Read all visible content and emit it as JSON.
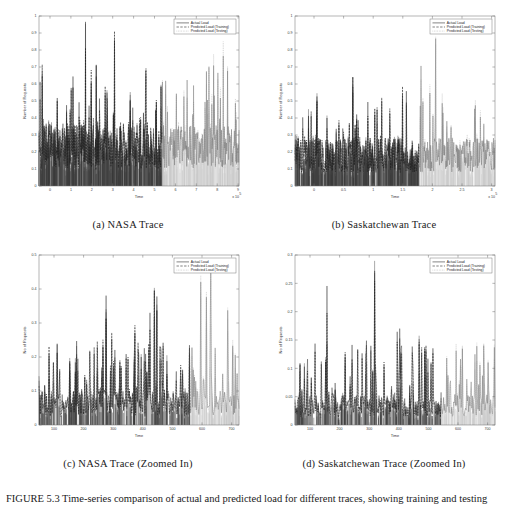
{
  "figure": {
    "caption": "FIGURE 5.3 Time-series comparison of actual and predicted load for different traces, showing training and testing phases."
  },
  "legend": {
    "entries": [
      {
        "label": "Actual Load",
        "style": "solid",
        "color": "#333333"
      },
      {
        "label": "Predicted Load (Training)",
        "style": "dashed",
        "color": "#2b2b2b"
      },
      {
        "label": "Predicted Load (Testing)",
        "style": "dotted",
        "color": "#9a9a9a"
      }
    ]
  },
  "panels": [
    {
      "id": "a",
      "caption": "(a) NASA Trace",
      "ylabel": "Number of Requests",
      "xlabel": "Time",
      "exponent": "x 10",
      "exponent_sup": "5",
      "yticks": [
        "0",
        "0.1",
        "0.2",
        "0.3",
        "0.4",
        "0.5",
        "0.6",
        "0.7",
        "0.8",
        "0.9",
        "1"
      ],
      "xticks": [
        "0",
        "1",
        "2",
        "3",
        "4",
        "5",
        "6",
        "7",
        "8",
        "9"
      ],
      "split_label": "training/testing boundary",
      "split_fraction": 0.615
    },
    {
      "id": "b",
      "caption": "(b) Saskatchewan Trace",
      "ylabel": "Number of Requests",
      "xlabel": "Time",
      "exponent": "x 10",
      "exponent_sup": "5",
      "yticks": [
        "0",
        "0.1",
        "0.2",
        "0.3",
        "0.4",
        "0.5",
        "0.6",
        "0.7",
        "0.8",
        "0.9",
        "1"
      ],
      "xticks": [
        "0",
        "0.5",
        "1",
        "1.5",
        "2",
        "2.5",
        "3"
      ],
      "split_label": "training/testing boundary",
      "split_fraction": 0.62
    },
    {
      "id": "c",
      "caption": "(c) NASA Trace (Zoomed In)",
      "ylabel": "No of Requests",
      "xlabel": "Time",
      "exponent": "",
      "exponent_sup": "",
      "yticks": [
        "0",
        "0.1",
        "0.2",
        "0.3",
        "0.4",
        "0.5"
      ],
      "xticks": [
        "100",
        "200",
        "300",
        "400",
        "500",
        "600",
        "700"
      ],
      "split_label": "training/testing boundary",
      "split_fraction": 0.755
    },
    {
      "id": "d",
      "caption": "(d) Saskatchewan Trace (Zoomed In)",
      "ylabel": "No of Requests",
      "xlabel": "Time",
      "exponent": "",
      "exponent_sup": "",
      "yticks": [
        "0",
        "0.05",
        "0.1",
        "0.15",
        "0.2",
        "0.25",
        "0.3"
      ],
      "xticks": [
        "100",
        "200",
        "300",
        "400",
        "500",
        "600",
        "700"
      ],
      "split_label": "training/testing boundary",
      "split_fraction": 0.73
    }
  ],
  "chart_data": [
    {
      "type": "line",
      "id": "a",
      "title": "(a) NASA Trace",
      "xlabel": "Time",
      "ylabel": "Number of Requests",
      "xlim": [
        0,
        9.4
      ],
      "ylim": [
        0,
        1
      ],
      "x_exponent": 100000,
      "grid": false,
      "legend_position": "top-right",
      "series": [
        {
          "name": "Actual Load",
          "style": "solid",
          "phase": "all",
          "peak_range": [
            0.0,
            1.0
          ],
          "baseline": 0.32,
          "note": "dense high-frequency signal spanning full x range"
        },
        {
          "name": "Predicted Load (Training)",
          "style": "dashed",
          "phase": "training",
          "x_range": [
            0,
            5.6
          ],
          "peak_range": [
            0.0,
            0.95
          ],
          "baseline": 0.3
        },
        {
          "name": "Predicted Load (Testing)",
          "style": "dotted",
          "phase": "testing",
          "x_range": [
            5.6,
            9.4
          ],
          "peak_range": [
            0.0,
            0.85
          ],
          "baseline": 0.28
        }
      ],
      "xticks": [
        0,
        1,
        2,
        3,
        4,
        5,
        6,
        7,
        8,
        9
      ],
      "yticks": [
        0,
        0.1,
        0.2,
        0.3,
        0.4,
        0.5,
        0.6,
        0.7,
        0.8,
        0.9,
        1
      ]
    },
    {
      "type": "line",
      "id": "b",
      "title": "(b) Saskatchewan Trace",
      "xlabel": "Time",
      "ylabel": "Number of Requests",
      "xlim": [
        0.25,
        3.1
      ],
      "ylim": [
        0,
        1
      ],
      "x_exponent": 100000,
      "grid": false,
      "legend_position": "top-right",
      "series": [
        {
          "name": "Actual Load",
          "style": "solid",
          "phase": "all",
          "peak_range": [
            0.0,
            1.0
          ],
          "baseline": 0.25
        },
        {
          "name": "Predicted Load (Training)",
          "style": "dashed",
          "phase": "training",
          "x_range": [
            0.25,
            1.9
          ],
          "peak_range": [
            0.0,
            0.69
          ],
          "baseline": 0.24
        },
        {
          "name": "Predicted Load (Testing)",
          "style": "dotted",
          "phase": "testing",
          "x_range": [
            1.9,
            3.1
          ],
          "peak_range": [
            0.0,
            0.81
          ],
          "baseline": 0.26
        }
      ],
      "xticks": [
        0.5,
        1,
        1.5,
        2,
        2.5,
        3
      ],
      "yticks": [
        0,
        0.1,
        0.2,
        0.3,
        0.4,
        0.5,
        0.6,
        0.7,
        0.8,
        0.9,
        1
      ]
    },
    {
      "type": "line",
      "id": "c",
      "title": "(c) NASA Trace (Zoomed In)",
      "xlabel": "Time",
      "ylabel": "No of Requests",
      "xlim": [
        60,
        700
      ],
      "ylim": [
        0,
        0.5
      ],
      "grid": false,
      "legend_position": "top-right",
      "series": [
        {
          "name": "Actual Load",
          "style": "solid",
          "phase": "all",
          "peak_range": [
            0.0,
            0.5
          ],
          "baseline": 0.08
        },
        {
          "name": "Predicted Load (Training)",
          "style": "dashed",
          "phase": "training",
          "x_range": [
            60,
            540
          ],
          "peak_range": [
            0.0,
            0.45
          ],
          "baseline": 0.08
        },
        {
          "name": "Predicted Load (Testing)",
          "style": "dotted",
          "phase": "testing",
          "x_range": [
            540,
            700
          ],
          "peak_range": [
            0.0,
            0.41
          ],
          "baseline": 0.07
        }
      ],
      "xticks": [
        100,
        200,
        300,
        400,
        500,
        600,
        700
      ],
      "yticks": [
        0,
        0.1,
        0.2,
        0.3,
        0.4,
        0.5
      ]
    },
    {
      "type": "line",
      "id": "d",
      "title": "(d) Saskatchewan Trace (Zoomed In)",
      "xlabel": "Time",
      "ylabel": "No of Requests",
      "xlim": [
        60,
        700
      ],
      "ylim": [
        0,
        0.3
      ],
      "grid": false,
      "legend_position": "top-right",
      "series": [
        {
          "name": "Actual Load",
          "style": "solid",
          "phase": "all",
          "peak_range": [
            0.0,
            0.3
          ],
          "baseline": 0.04
        },
        {
          "name": "Predicted Load (Training)",
          "style": "dashed",
          "phase": "training",
          "x_range": [
            60,
            510
          ],
          "peak_range": [
            0.0,
            0.21
          ],
          "baseline": 0.045
        },
        {
          "name": "Predicted Load (Testing)",
          "style": "dotted",
          "phase": "testing",
          "x_range": [
            510,
            700
          ],
          "peak_range": [
            0.0,
            0.23
          ],
          "baseline": 0.04
        }
      ],
      "xticks": [
        100,
        200,
        300,
        400,
        500,
        600,
        700
      ],
      "yticks": [
        0,
        0.05,
        0.1,
        0.15,
        0.2,
        0.25,
        0.3
      ]
    }
  ]
}
